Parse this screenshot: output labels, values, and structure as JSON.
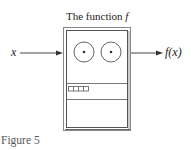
{
  "figure": {
    "title_prefix": "The function ",
    "title_symbol": "f",
    "input_label": "x",
    "output_label": "f(x)",
    "caption": "Figure 5"
  },
  "machine": {
    "dials": 2,
    "display_cells": 4,
    "sections": [
      "dials",
      "display",
      "blank"
    ]
  },
  "colors": {
    "line": "#444444",
    "box_outer": "#777777",
    "background": "#ffffff"
  }
}
